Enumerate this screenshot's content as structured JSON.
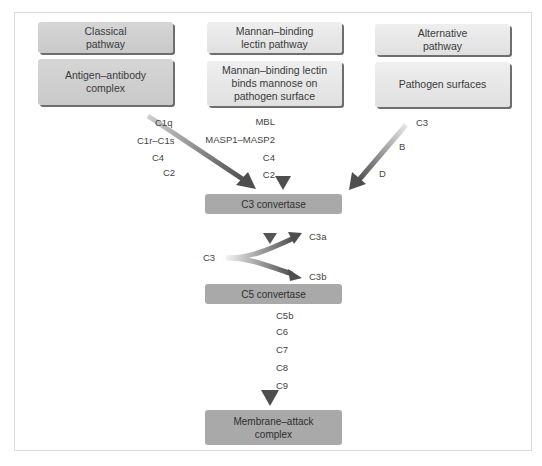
{
  "diagram": {
    "pathways": [
      {
        "name": "Classical\npathway",
        "trigger": "Antigen–antibody\ncomplex",
        "components": [
          "C1q",
          "C1r–C1s",
          "C4",
          "C2"
        ]
      },
      {
        "name": "Mannan–binding\nlectin pathway",
        "trigger": "Mannan–binding lectin\nbinds mannose on\npathogen surface",
        "components": [
          "MBL",
          "MASP1–MASP2",
          "C4",
          "C2"
        ]
      },
      {
        "name": "Alternative\npathway",
        "trigger": "Pathogen surfaces",
        "components": [
          "C3",
          "B",
          "D"
        ]
      }
    ],
    "c3_convertase": "C3 convertase",
    "c3_cleavage": {
      "input": "C3",
      "products": [
        "C3a",
        "C3b"
      ]
    },
    "c5_convertase": "C5 convertase",
    "terminal_components": [
      "C5b",
      "C6",
      "C7",
      "C8",
      "C9"
    ],
    "mac": "Membrane–attack\ncomplex"
  },
  "colors": {
    "box_light": "#e6e6e6",
    "box_classical": "#cfcfcf",
    "box_mid": "#a9a9a9",
    "box_shadow": "#6e6e6e",
    "arrow": "#555555",
    "frame_border": "#dcdcdc"
  }
}
